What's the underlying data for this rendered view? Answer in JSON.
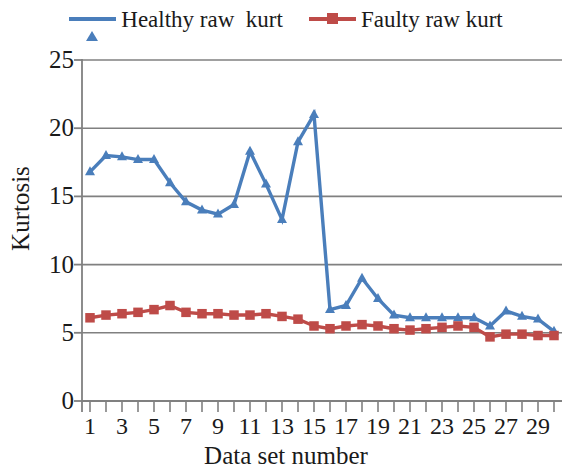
{
  "chart_data": {
    "type": "line",
    "title": "",
    "xlabel": "Data set number",
    "ylabel": "Kurtosis",
    "xlim": [
      0.5,
      30.5
    ],
    "ylim": [
      0,
      25
    ],
    "ytick_labels": [
      "25",
      "20",
      "15",
      "10",
      "5",
      "0"
    ],
    "ytick_values": [
      25,
      20,
      15,
      10,
      5,
      0
    ],
    "xtick_labels": [
      "1",
      "3",
      "5",
      "7",
      "9",
      "11",
      "13",
      "15",
      "17",
      "19",
      "21",
      "23",
      "25",
      "27",
      "29"
    ],
    "xtick_values": [
      1,
      3,
      5,
      7,
      9,
      11,
      13,
      15,
      17,
      19,
      21,
      23,
      25,
      27,
      29
    ],
    "x": [
      1,
      2,
      3,
      4,
      5,
      6,
      7,
      8,
      9,
      10,
      11,
      12,
      13,
      14,
      15,
      16,
      17,
      18,
      19,
      20,
      21,
      22,
      23,
      24,
      25,
      26,
      27,
      28,
      29,
      30
    ],
    "grid": "horizontal",
    "legend_position": "top",
    "series": [
      {
        "name": "Healthy raw  kurt",
        "color": "#4a7ebb",
        "marker": "triangle",
        "values": [
          16.8,
          18.0,
          17.9,
          17.7,
          17.7,
          16.0,
          14.6,
          14.0,
          13.7,
          14.4,
          18.3,
          15.9,
          13.3,
          19.0,
          21.0,
          6.7,
          7.0,
          9.0,
          7.5,
          6.3,
          6.1,
          6.1,
          6.1,
          6.1,
          6.1,
          5.5,
          6.6,
          6.2,
          6.0,
          5.1
        ]
      },
      {
        "name": "Faulty raw kurt",
        "color": "#be4b48",
        "marker": "square",
        "values": [
          6.1,
          6.3,
          6.4,
          6.5,
          6.7,
          7.0,
          6.5,
          6.4,
          6.4,
          6.3,
          6.3,
          6.4,
          6.2,
          6.0,
          5.5,
          5.3,
          5.5,
          5.6,
          5.5,
          5.3,
          5.2,
          5.3,
          5.4,
          5.5,
          5.4,
          4.7,
          4.9,
          4.9,
          4.8,
          4.8
        ]
      }
    ]
  },
  "legend": {
    "entries": [
      {
        "label": "Healthy raw  kurt"
      },
      {
        "label": "Faulty raw kurt"
      }
    ]
  },
  "axes": {
    "ylabel": "Kurtosis",
    "xlabel": "Data set number"
  }
}
